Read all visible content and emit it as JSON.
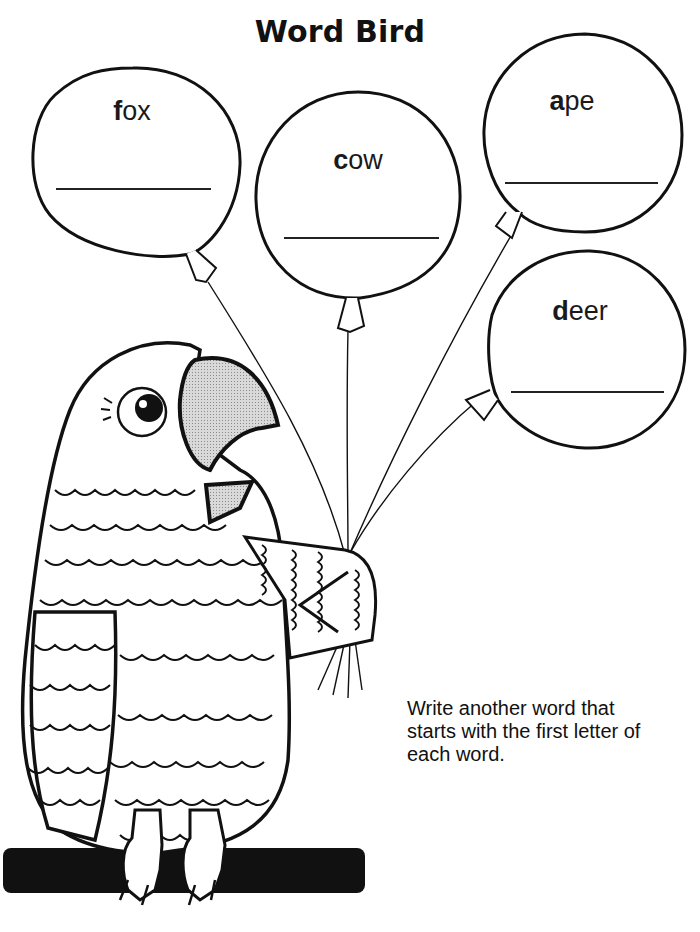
{
  "page": {
    "title": "Word Bird",
    "instructions": "Write another word that starts with the first letter of each word."
  },
  "balloons": [
    {
      "first_letter": "f",
      "rest": "ox",
      "word": "fox",
      "answer": ""
    },
    {
      "first_letter": "c",
      "rest": "ow",
      "word": "cow",
      "answer": ""
    },
    {
      "first_letter": "a",
      "rest": "pe",
      "word": "ape",
      "answer": ""
    },
    {
      "first_letter": "d",
      "rest": "eer",
      "word": "deer",
      "answer": ""
    }
  ],
  "illustration": {
    "subject": "parrot holding four balloon strings, perched on a branch",
    "beak_color": "#bdbdbd",
    "line_color": "#111111",
    "perch_color": "#111111"
  }
}
